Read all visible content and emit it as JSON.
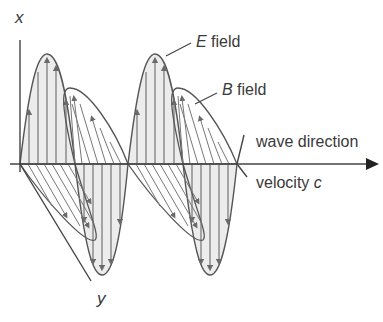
{
  "diagram": {
    "labels": {
      "x_axis": "x",
      "y_axis": "y",
      "e_field_symbol": "E",
      "e_field_word": " field",
      "b_field_symbol": "B",
      "b_field_word": " field",
      "wave_direction": "wave direction",
      "velocity_word": "velocity ",
      "velocity_symbol": "c"
    },
    "colors": {
      "stroke": "#4a4a4a",
      "fill": "#e9e9e9",
      "text": "#3a3a3a"
    },
    "components": [
      {
        "name": "E field",
        "orientation": "vertical (x)",
        "lobes": 4
      },
      {
        "name": "B field",
        "orientation": "diagonal (y)",
        "lobes": 4
      },
      {
        "name": "wave direction axis",
        "orientation": "horizontal",
        "arrow": "right"
      }
    ]
  }
}
